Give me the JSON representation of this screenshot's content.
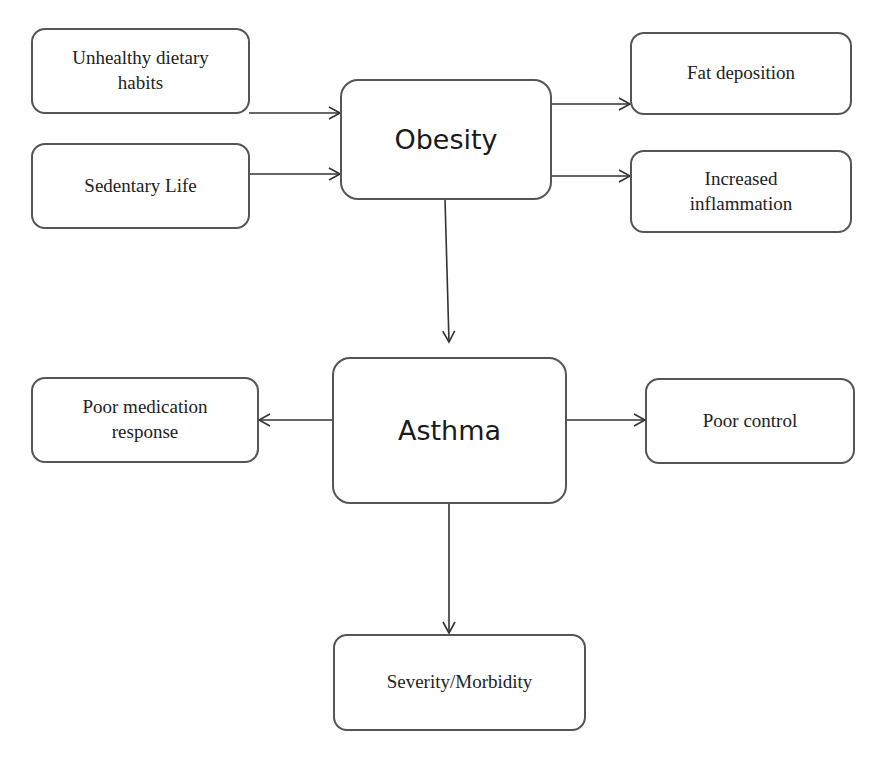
{
  "nodes": {
    "unhealthy_diet": "Unhealthy dietary habits",
    "sedentary": "Sedentary Life",
    "obesity": "Obesity",
    "fat_deposition": "Fat deposition",
    "inflammation": "Increased inflammation",
    "asthma": "Asthma",
    "poor_medication": "Poor medication response",
    "poor_control": "Poor control",
    "severity": "Severity/Morbidity"
  },
  "edges": [
    {
      "from": "Unhealthy dietary habits",
      "to": "Obesity"
    },
    {
      "from": "Sedentary Life",
      "to": "Obesity"
    },
    {
      "from": "Obesity",
      "to": "Fat deposition"
    },
    {
      "from": "Obesity",
      "to": "Increased inflammation"
    },
    {
      "from": "Obesity",
      "to": "Asthma"
    },
    {
      "from": "Asthma",
      "to": "Poor medication response"
    },
    {
      "from": "Asthma",
      "to": "Poor control"
    },
    {
      "from": "Asthma",
      "to": "Severity/Morbidity"
    }
  ],
  "colors": {
    "stroke": "#555555",
    "text": "#222222",
    "background": "#ffffff"
  }
}
